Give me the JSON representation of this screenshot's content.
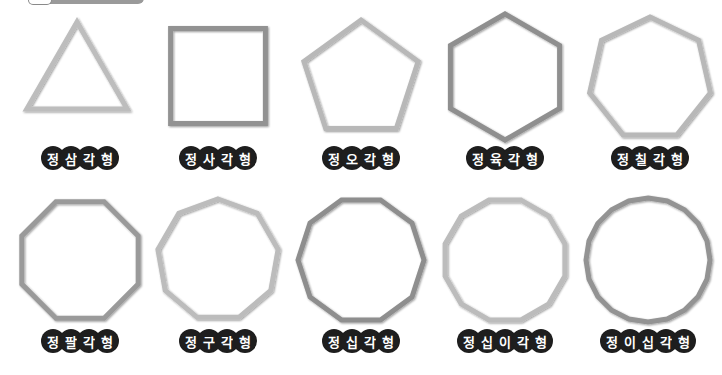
{
  "header": {
    "tab_label": ""
  },
  "colors": {
    "stroke_light": "#b8b8b8",
    "stroke_dark": "#8c8c8c",
    "label_bg": "#1e1e1e",
    "label_text": "#ffffff"
  },
  "shapes": [
    {
      "name": "triangle",
      "sides": 3,
      "label": "정삼각형",
      "cx": 77,
      "cy": 80,
      "r": 58,
      "rot": -90,
      "labelX": 80,
      "labelY": 147,
      "stroke": "#bdbdbd"
    },
    {
      "name": "square",
      "sides": 4,
      "label": "정사각형",
      "cx": 218,
      "cy": 76,
      "r": 67,
      "rot": -45,
      "labelX": 218,
      "labelY": 147,
      "stroke": "#929292"
    },
    {
      "name": "pentagon",
      "sides": 5,
      "label": "정오각형",
      "cx": 361,
      "cy": 80,
      "r": 60,
      "rot": -90,
      "labelX": 361,
      "labelY": 147,
      "stroke": "#b8b8b8"
    },
    {
      "name": "hexagon",
      "sides": 6,
      "label": "정육각형",
      "cx": 505,
      "cy": 77,
      "r": 63,
      "rot": -90,
      "labelX": 505,
      "labelY": 147,
      "stroke": "#8f8f8f"
    },
    {
      "name": "heptagon",
      "sides": 7,
      "label": "정칠각형",
      "cx": 650,
      "cy": 79,
      "r": 62,
      "rot": -90,
      "labelX": 650,
      "labelY": 147,
      "stroke": "#b8b8b8"
    },
    {
      "name": "octagon",
      "sides": 8,
      "label": "정팔각형",
      "cx": 80,
      "cy": 260,
      "r": 63,
      "rot": -67.5,
      "labelX": 80,
      "labelY": 330,
      "stroke": "#9a9a9a"
    },
    {
      "name": "nonagon",
      "sides": 9,
      "label": "정구각형",
      "cx": 218,
      "cy": 260,
      "r": 61,
      "rot": -90,
      "labelX": 218,
      "labelY": 330,
      "stroke": "#bcbcbc"
    },
    {
      "name": "decagon",
      "sides": 10,
      "label": "정십각형",
      "cx": 361,
      "cy": 260,
      "r": 63,
      "rot": -72,
      "labelX": 361,
      "labelY": 330,
      "stroke": "#8e8e8e"
    },
    {
      "name": "dodecagon",
      "sides": 12,
      "label": "정십이각형",
      "cx": 505,
      "cy": 260,
      "r": 62,
      "rot": -75,
      "labelX": 505,
      "labelY": 330,
      "stroke": "#bcbcbc"
    },
    {
      "name": "icosagon",
      "sides": 20,
      "label": "정이십각형",
      "cx": 648,
      "cy": 260,
      "r": 62,
      "rot": -90,
      "labelX": 648,
      "labelY": 330,
      "stroke": "#939393"
    }
  ]
}
